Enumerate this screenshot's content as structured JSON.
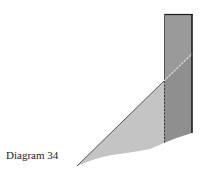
{
  "caption": "Diagram 34",
  "colors": {
    "background": "#ffffff",
    "prism_fill": "#9a9a9a",
    "triangle_fill": "#c4c4c4",
    "edge_dark": "#1a1a1a",
    "edge_mid": "#555555",
    "dashed_line": "#dddddd"
  },
  "shapes": {
    "rectangle": {
      "x": 164,
      "y": 14,
      "width": 28,
      "height": 119
    },
    "triangle": {
      "apex": [
        164,
        81
      ],
      "tip": [
        77,
        166
      ],
      "base_right": [
        164,
        143
      ]
    },
    "dashed_vertical": {
      "x": 164,
      "y1": 81,
      "y2": 143
    },
    "dashed_diagonal": {
      "x1": 164,
      "y1": 81,
      "x2": 192,
      "y2": 54
    }
  }
}
